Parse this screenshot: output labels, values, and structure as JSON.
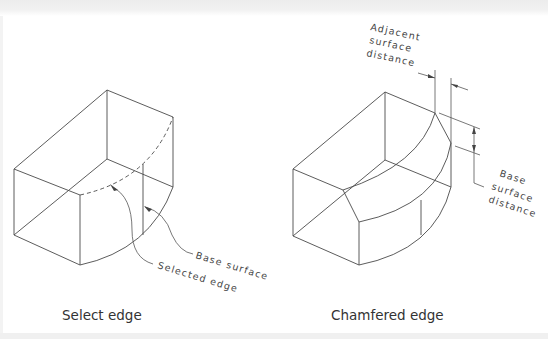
{
  "figure": {
    "left_panel": {
      "caption": "Select edge",
      "labels": {
        "base_surface": "Base surface",
        "selected_edge": "Selected edge"
      }
    },
    "right_panel": {
      "caption": "Chamfered edge",
      "labels": {
        "adjacent_line1": "Adjacent",
        "adjacent_line2": "surface",
        "adjacent_line3": "distance",
        "base_line1": "Base",
        "base_line2": "surface",
        "base_line3": "distance"
      }
    }
  },
  "colors": {
    "line": "#4a4a4a",
    "text": "#333333",
    "background": "#ffffff"
  }
}
